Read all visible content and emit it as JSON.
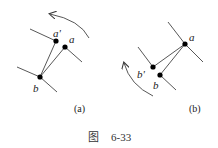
{
  "figure": {
    "caption_prefix": "图",
    "caption_number": "6-33"
  },
  "panels": [
    {
      "id": "a",
      "sublabel": "(a)",
      "points": [
        {
          "name": "a_prime",
          "label": "a'",
          "x": 56,
          "y": 41
        },
        {
          "name": "a",
          "label": "a",
          "x": 65,
          "y": 47
        },
        {
          "name": "b",
          "label": "b",
          "x": 40,
          "y": 77
        }
      ],
      "rotation_arrow": "counterclockwise"
    },
    {
      "id": "b",
      "sublabel": "(b)",
      "points": [
        {
          "name": "a",
          "label": "a",
          "x": 185,
          "y": 44
        },
        {
          "name": "b_prime",
          "label": "b'",
          "x": 153,
          "y": 67
        },
        {
          "name": "b",
          "label": "b",
          "x": 160,
          "y": 75
        }
      ],
      "rotation_arrow": "counterclockwise"
    }
  ],
  "colors": {
    "line": "#333333",
    "point": "#000000"
  }
}
